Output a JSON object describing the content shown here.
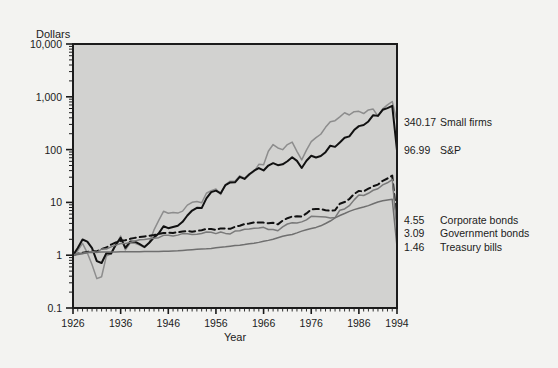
{
  "chart_data": {
    "type": "line",
    "title": "",
    "xlabel": "Year",
    "ylabel": "Dollars",
    "log_y": true,
    "ylim": [
      0.1,
      10000
    ],
    "xlim": [
      1926,
      1994
    ],
    "grid": false,
    "legend_position": "right-of-plot",
    "y_ticks": [
      "10,000",
      "1,000",
      "100",
      "10",
      "1",
      "0.1"
    ],
    "y_tick_values": [
      10000,
      1000,
      100,
      10,
      1,
      0.1
    ],
    "x_ticks": [
      "1926",
      "1936",
      "1946",
      "1956",
      "1966",
      "1976",
      "1986",
      "1994"
    ],
    "x_tick_values": [
      1926,
      1936,
      1946,
      1956,
      1966,
      1976,
      1986,
      1994
    ],
    "end_labels": [
      {
        "value": "340.17",
        "name": "Small firms"
      },
      {
        "value": "96.99",
        "name": "S&P"
      },
      {
        "value": "4.55",
        "name": "Corporate bonds"
      },
      {
        "value": "3.09",
        "name": "Government bonds"
      },
      {
        "value": "1.46",
        "name": "Treasury bills"
      }
    ],
    "series": [
      {
        "name": "Small firms",
        "final_value": 340.17,
        "color": "#8d8d8d",
        "style": "solid",
        "width": 1.5,
        "x": [
          1926,
          1927,
          1928,
          1929,
          1930,
          1931,
          1932,
          1933,
          1934,
          1935,
          1936,
          1937,
          1938,
          1939,
          1940,
          1941,
          1942,
          1943,
          1944,
          1945,
          1946,
          1947,
          1948,
          1949,
          1950,
          1951,
          1952,
          1953,
          1954,
          1955,
          1956,
          1957,
          1958,
          1959,
          1960,
          1961,
          1962,
          1963,
          1964,
          1965,
          1966,
          1967,
          1968,
          1969,
          1970,
          1971,
          1972,
          1973,
          1974,
          1975,
          1976,
          1977,
          1978,
          1979,
          1980,
          1981,
          1982,
          1983,
          1984,
          1985,
          1986,
          1987,
          1988,
          1989,
          1990,
          1991,
          1992,
          1993,
          1994
        ],
        "values": [
          1.0,
          1.22,
          1.68,
          1.11,
          0.66,
          0.36,
          0.39,
          0.96,
          1.07,
          1.54,
          2.3,
          1.26,
          1.69,
          1.68,
          1.56,
          1.4,
          1.73,
          3.01,
          4.57,
          6.79,
          6.25,
          6.46,
          6.27,
          6.84,
          8.87,
          10.03,
          10.37,
          9.81,
          14.91,
          16.69,
          17.89,
          14.12,
          21.81,
          25.18,
          25.07,
          31.84,
          28.68,
          33.03,
          38.52,
          52.69,
          51.5,
          92.88,
          124.63,
          107.39,
          99.81,
          124.63,
          138.63,
          92.86,
          63.84,
          97.74,
          142.02,
          168.0,
          195.31,
          264.47,
          336.33,
          352.81,
          417.59,
          499.9,
          452.52,
          522.41,
          529.86,
          481.8,
          564.83,
          584.65,
          427.69,
          589.35,
          703.92,
          815.0,
          340.17
        ]
      },
      {
        "name": "S&P",
        "final_value": 96.99,
        "color": "#111111",
        "style": "solid",
        "width": 2.0,
        "x": [
          1926,
          1927,
          1928,
          1929,
          1930,
          1931,
          1932,
          1933,
          1934,
          1935,
          1936,
          1937,
          1938,
          1939,
          1940,
          1941,
          1942,
          1943,
          1944,
          1945,
          1946,
          1947,
          1948,
          1949,
          1950,
          1951,
          1952,
          1953,
          1954,
          1955,
          1956,
          1957,
          1958,
          1959,
          1960,
          1961,
          1962,
          1963,
          1964,
          1965,
          1966,
          1967,
          1968,
          1969,
          1970,
          1971,
          1972,
          1973,
          1974,
          1975,
          1976,
          1977,
          1978,
          1979,
          1980,
          1981,
          1982,
          1983,
          1984,
          1985,
          1986,
          1987,
          1988,
          1989,
          1990,
          1991,
          1992,
          1993,
          1994
        ],
        "values": [
          1.0,
          1.37,
          1.98,
          1.81,
          1.36,
          0.77,
          0.71,
          1.09,
          1.08,
          1.59,
          2.13,
          1.38,
          1.81,
          1.8,
          1.62,
          1.43,
          1.72,
          2.17,
          2.59,
          3.53,
          3.25,
          3.43,
          3.61,
          4.29,
          5.65,
          7.01,
          7.88,
          7.81,
          11.91,
          15.67,
          16.7,
          14.9,
          21.35,
          23.9,
          24.03,
          30.49,
          27.82,
          34.16,
          39.78,
          44.74,
          40.23,
          49.85,
          55.35,
          50.65,
          52.66,
          60.18,
          71.61,
          61.09,
          44.91,
          61.63,
          76.31,
          70.86,
          75.49,
          89.44,
          118.49,
          112.67,
          136.9,
          167.75,
          178.24,
          234.75,
          278.46,
          293.14,
          341.32,
          449.0,
          435.06,
          567.68,
          611.11,
          672.22,
          96.99
        ]
      },
      {
        "name": "Corporate bonds",
        "final_value": 4.55,
        "color": "#111111",
        "style": "dashed",
        "width": 2.0,
        "x": [
          1926,
          1927,
          1928,
          1929,
          1930,
          1931,
          1932,
          1933,
          1934,
          1935,
          1936,
          1937,
          1938,
          1939,
          1940,
          1941,
          1942,
          1943,
          1944,
          1945,
          1946,
          1947,
          1948,
          1949,
          1950,
          1951,
          1952,
          1953,
          1954,
          1955,
          1956,
          1957,
          1958,
          1959,
          1960,
          1961,
          1962,
          1963,
          1964,
          1965,
          1966,
          1967,
          1968,
          1969,
          1970,
          1971,
          1972,
          1973,
          1974,
          1975,
          1976,
          1977,
          1978,
          1979,
          1980,
          1981,
          1982,
          1983,
          1984,
          1985,
          1986,
          1987,
          1988,
          1989,
          1990,
          1991,
          1992,
          1993,
          1994
        ],
        "values": [
          1.0,
          1.07,
          1.11,
          1.15,
          1.2,
          1.18,
          1.31,
          1.4,
          1.59,
          1.75,
          1.87,
          1.92,
          2.04,
          2.13,
          2.2,
          2.27,
          2.34,
          2.41,
          2.53,
          2.63,
          2.67,
          2.64,
          2.72,
          2.81,
          2.87,
          2.79,
          2.89,
          2.98,
          3.14,
          3.12,
          3.02,
          3.22,
          3.21,
          3.16,
          3.45,
          3.62,
          3.89,
          3.98,
          4.17,
          4.15,
          4.14,
          4.01,
          4.11,
          3.84,
          4.52,
          5.02,
          5.39,
          5.46,
          5.4,
          6.18,
          7.38,
          7.52,
          7.44,
          7.12,
          6.93,
          7.11,
          9.42,
          10.15,
          11.58,
          14.45,
          16.48,
          16.19,
          18.15,
          20.23,
          21.74,
          25.65,
          28.36,
          32.17,
          4.55
        ]
      },
      {
        "name": "Government bonds",
        "final_value": 3.09,
        "color": "#7a7a7a",
        "style": "solid",
        "width": 1.5,
        "x": [
          1926,
          1927,
          1928,
          1929,
          1930,
          1931,
          1932,
          1933,
          1934,
          1935,
          1936,
          1937,
          1938,
          1939,
          1940,
          1941,
          1942,
          1943,
          1944,
          1945,
          1946,
          1947,
          1948,
          1949,
          1950,
          1951,
          1952,
          1953,
          1954,
          1955,
          1956,
          1957,
          1958,
          1959,
          1960,
          1961,
          1962,
          1963,
          1964,
          1965,
          1966,
          1967,
          1968,
          1969,
          1970,
          1971,
          1972,
          1973,
          1974,
          1975,
          1976,
          1977,
          1978,
          1979,
          1980,
          1981,
          1982,
          1983,
          1984,
          1985,
          1986,
          1987,
          1988,
          1989,
          1990,
          1991,
          1992,
          1993,
          1994
        ],
        "values": [
          1.0,
          1.09,
          1.09,
          1.13,
          1.18,
          1.12,
          1.31,
          1.31,
          1.44,
          1.55,
          1.66,
          1.66,
          1.75,
          1.85,
          1.96,
          1.98,
          2.04,
          2.09,
          2.15,
          2.38,
          2.38,
          2.32,
          2.4,
          2.56,
          2.56,
          2.46,
          2.49,
          2.57,
          2.75,
          2.71,
          2.56,
          2.75,
          2.59,
          2.53,
          2.87,
          2.9,
          3.1,
          3.13,
          3.24,
          3.26,
          3.37,
          3.06,
          3.06,
          2.9,
          3.44,
          3.9,
          4.12,
          4.09,
          4.28,
          4.67,
          5.44,
          5.4,
          5.35,
          5.28,
          5.07,
          5.16,
          7.1,
          7.53,
          8.67,
          11.16,
          13.87,
          13.53,
          14.9,
          16.99,
          18.11,
          21.48,
          23.54,
          27.11,
          3.09
        ]
      },
      {
        "name": "Treasury bills",
        "final_value": 1.46,
        "color": "#6f6f6f",
        "style": "solid",
        "width": 1.5,
        "x": [
          1926,
          1927,
          1928,
          1929,
          1930,
          1931,
          1932,
          1933,
          1934,
          1935,
          1936,
          1937,
          1938,
          1939,
          1940,
          1941,
          1942,
          1943,
          1944,
          1945,
          1946,
          1947,
          1948,
          1949,
          1950,
          1951,
          1952,
          1953,
          1954,
          1955,
          1956,
          1957,
          1958,
          1959,
          1960,
          1961,
          1962,
          1963,
          1964,
          1965,
          1966,
          1967,
          1968,
          1969,
          1970,
          1971,
          1972,
          1973,
          1974,
          1975,
          1976,
          1977,
          1978,
          1979,
          1980,
          1981,
          1982,
          1983,
          1984,
          1985,
          1986,
          1987,
          1988,
          1989,
          1990,
          1991,
          1992,
          1993,
          1994
        ],
        "values": [
          1.0,
          1.03,
          1.07,
          1.12,
          1.13,
          1.14,
          1.15,
          1.15,
          1.15,
          1.15,
          1.16,
          1.16,
          1.16,
          1.16,
          1.16,
          1.17,
          1.17,
          1.18,
          1.18,
          1.19,
          1.19,
          1.2,
          1.21,
          1.23,
          1.25,
          1.27,
          1.29,
          1.31,
          1.32,
          1.34,
          1.38,
          1.42,
          1.44,
          1.48,
          1.52,
          1.55,
          1.59,
          1.64,
          1.69,
          1.75,
          1.83,
          1.91,
          2.01,
          2.14,
          2.28,
          2.38,
          2.47,
          2.65,
          2.86,
          3.04,
          3.19,
          3.36,
          3.6,
          3.98,
          4.44,
          5.09,
          5.65,
          6.15,
          6.76,
          7.29,
          7.74,
          8.17,
          8.69,
          9.43,
          10.17,
          10.74,
          11.12,
          11.45,
          1.46
        ]
      }
    ]
  }
}
